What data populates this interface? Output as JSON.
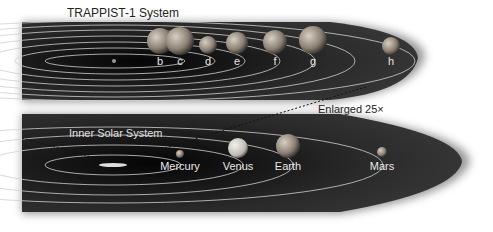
{
  "trappist": {
    "title": "TRAPPIST-1 System",
    "planets": [
      {
        "label": "b",
        "x": 160,
        "y": 41,
        "r": 13
      },
      {
        "label": "c",
        "x": 180,
        "y": 41,
        "r": 14
      },
      {
        "label": "d",
        "x": 208,
        "y": 45,
        "r": 9
      },
      {
        "label": "e",
        "x": 237,
        "y": 43,
        "r": 11
      },
      {
        "label": "f",
        "x": 275,
        "y": 42,
        "r": 12
      },
      {
        "label": "g",
        "x": 313,
        "y": 40,
        "r": 14
      },
      {
        "label": "h",
        "x": 391,
        "y": 46,
        "r": 9
      }
    ]
  },
  "solar": {
    "title": "Inner Solar System",
    "planets": [
      {
        "label": "Mercury",
        "x": 180,
        "y": 154,
        "r": 4
      },
      {
        "label": "Venus",
        "x": 238,
        "y": 148,
        "r": 10
      },
      {
        "label": "Earth",
        "x": 288,
        "y": 146,
        "r": 12
      },
      {
        "label": "Mars",
        "x": 382,
        "y": 152,
        "r": 5
      }
    ]
  },
  "annotation": "Enlarged 25×"
}
